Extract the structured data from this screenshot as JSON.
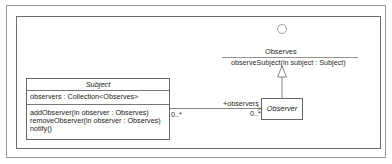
{
  "diagram": {
    "type": "UML class diagram",
    "interface": {
      "name": "Observes",
      "operations": [
        "observeSubject(in subject : Subject)"
      ],
      "notation": "lollipop-circle"
    },
    "classes": [
      {
        "name": "Subject",
        "abstract": true,
        "attributes": [
          "observers : Collection<Observes>"
        ],
        "operations": [
          "addObserver(in observer : Observes)",
          "removeObserver(in observer : Observes)",
          "notify()"
        ]
      },
      {
        "name": "Observer",
        "abstract": true,
        "attributes": [],
        "operations": []
      }
    ],
    "relationships": [
      {
        "type": "association",
        "from": "Subject",
        "to": "Observer",
        "source_multiplicity": "0..*",
        "target_role": "+observers",
        "target_multiplicity": "0..*"
      },
      {
        "type": "realization",
        "from": "Observer",
        "to": "Observes"
      }
    ]
  },
  "colors": {
    "line": "#666666",
    "frame_outer": "#9a9a9a",
    "frame_inner": "#6e6e6e",
    "text": "#2a2a2a",
    "background": "#ffffff"
  }
}
